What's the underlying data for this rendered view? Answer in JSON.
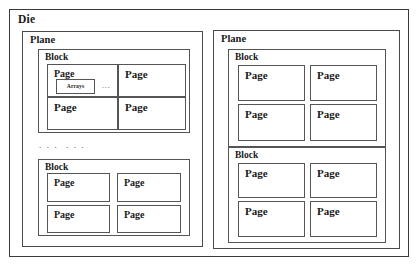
{
  "diagram": {
    "title": "Die",
    "type": "nand-flash-hierarchy",
    "colors": {
      "background": "#ffffff",
      "border": "#4a4a4a",
      "text": "#1a1a1a"
    },
    "planes": [
      {
        "label": "Plane",
        "blocks": [
          {
            "label": "Block",
            "pages": [
              {
                "label": "Page",
                "inner": {
                  "label": "Arrays",
                  "ellipsis": "..."
                }
              },
              {
                "label": "Page"
              },
              {
                "label": "Page"
              },
              {
                "label": "Page"
              }
            ]
          },
          {
            "label": "Block",
            "pages": [
              {
                "label": "Page"
              },
              {
                "label": "Page"
              },
              {
                "label": "Page"
              },
              {
                "label": "Page"
              }
            ]
          }
        ],
        "block_separator": ". . .  . . ."
      },
      {
        "label": "Plane",
        "blocks": [
          {
            "label": "Block",
            "pages": [
              {
                "label": "Page"
              },
              {
                "label": "Page"
              },
              {
                "label": "Page"
              },
              {
                "label": "Page"
              }
            ]
          },
          {
            "label": "Block",
            "pages": [
              {
                "label": "Page"
              },
              {
                "label": "Page"
              },
              {
                "label": "Page"
              },
              {
                "label": "Page"
              }
            ]
          }
        ]
      }
    ]
  }
}
